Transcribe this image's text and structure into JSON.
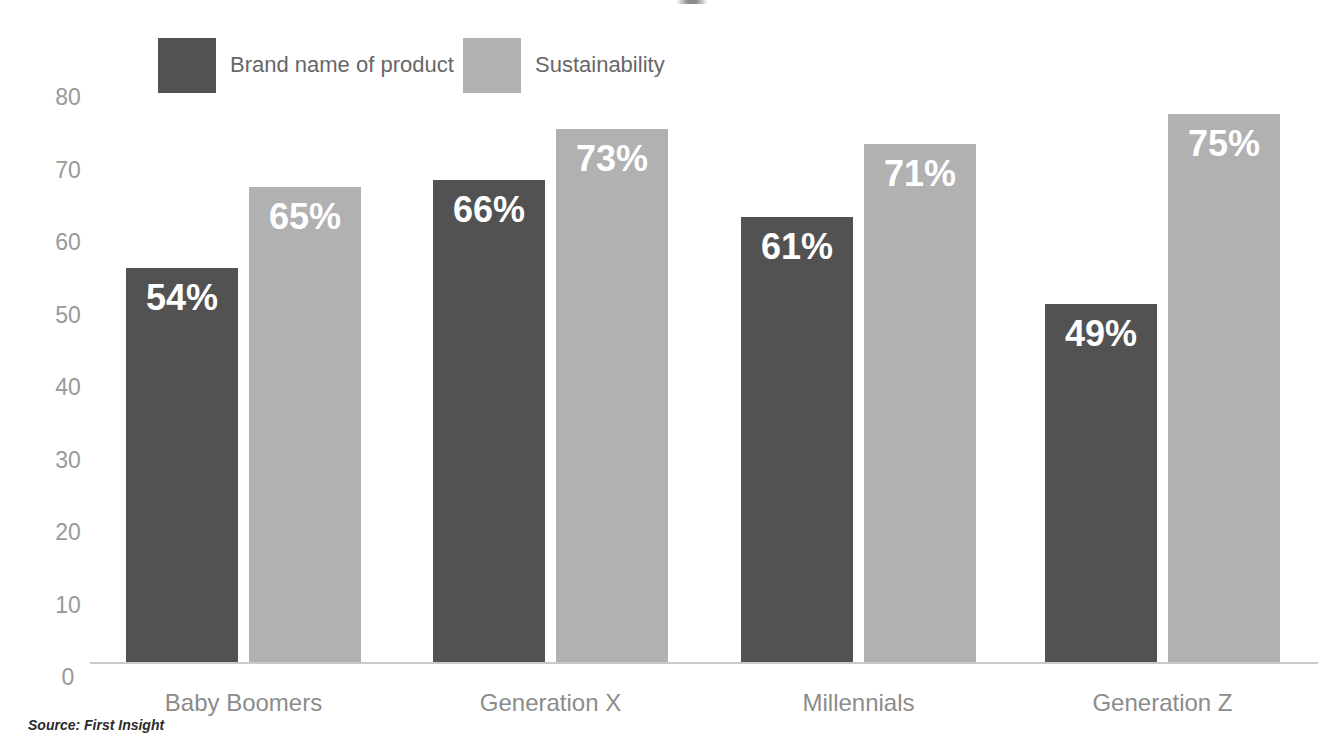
{
  "chart_data": {
    "type": "bar",
    "title": "",
    "categories": [
      "Baby Boomers",
      "Generation X",
      "Millennials",
      "Generation Z"
    ],
    "series": [
      {
        "name": "Brand name of product",
        "color": "#525252",
        "values": [
          54,
          66,
          61,
          49
        ]
      },
      {
        "name": "Sustainability",
        "color": "#b1b1b1",
        "values": [
          65,
          73,
          71,
          75
        ]
      }
    ],
    "value_suffix": "%",
    "xlabel": "",
    "ylabel": "",
    "y_ticks": [
      0,
      10,
      20,
      30,
      40,
      50,
      60,
      70,
      80
    ],
    "ylim": [
      0,
      80
    ],
    "grid": false,
    "legend_position": "top-left",
    "source_note": "Source: First Insight"
  },
  "colors": {
    "background": "#ffffff",
    "value_label": "#ffffff",
    "axis_line": "#c9c9c9",
    "tick_label": "#999999",
    "category_label": "#8c8c8c",
    "legend_label": "#676767",
    "source_note": "#2b2b2b"
  }
}
